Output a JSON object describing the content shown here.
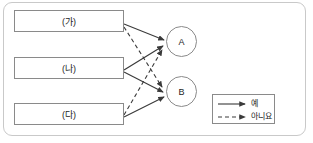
{
  "diagram": {
    "boxes": [
      {
        "id": "ga",
        "label": "(가)"
      },
      {
        "id": "na",
        "label": "(나)"
      },
      {
        "id": "da",
        "label": "(다)"
      }
    ],
    "circles": [
      {
        "id": "A",
        "label": "A"
      },
      {
        "id": "B",
        "label": "B"
      }
    ],
    "edges": [
      {
        "from": "ga",
        "to": "A",
        "style": "solid"
      },
      {
        "from": "ga",
        "to": "B",
        "style": "dashed"
      },
      {
        "from": "na",
        "to": "A",
        "style": "solid"
      },
      {
        "from": "na",
        "to": "B",
        "style": "solid"
      },
      {
        "from": "da",
        "to": "A",
        "style": "dashed"
      },
      {
        "from": "da",
        "to": "B",
        "style": "solid"
      }
    ],
    "legend": {
      "items": [
        {
          "style": "solid",
          "label": "예"
        },
        {
          "style": "dashed",
          "label": "아니요"
        }
      ]
    },
    "colors": {
      "frame_border": "#c9c9c9",
      "shape_border": "#8a8a8a",
      "line": "#3a3a3a",
      "text": "#1d1d1d",
      "background": "#ffffff"
    }
  }
}
